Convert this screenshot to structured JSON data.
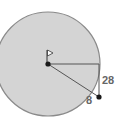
{
  "diagram": {
    "title": "",
    "shape": "circle",
    "colors": {
      "fill": "#d4d4d4",
      "stroke": "#8a8a8a",
      "line": "#555555",
      "point": "#1a1a1a",
      "label": "#666666",
      "flag": "#ffffff"
    },
    "labels": {
      "vertical_segment": "28",
      "outside_segment": "8"
    },
    "elements": [
      {
        "type": "center-point",
        "note": "flag at center"
      },
      {
        "type": "radius",
        "direction": "horizontal"
      },
      {
        "type": "vertical-segment",
        "label": "28"
      },
      {
        "type": "slanted-segment",
        "to": "external point"
      },
      {
        "type": "outside-segment",
        "label": "8"
      },
      {
        "type": "external-point"
      }
    ]
  }
}
